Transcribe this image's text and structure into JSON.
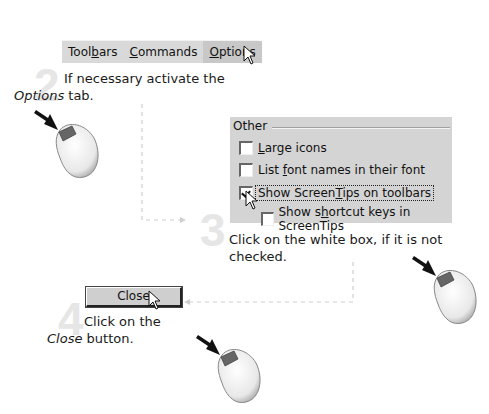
{
  "steps": [
    {
      "number": "2",
      "text_before": "If necessary activate the ",
      "text_emph": "Options",
      "text_after": " tab."
    },
    {
      "number": "3",
      "text": "Click on the white box, if it is not checked."
    },
    {
      "number": "4",
      "text_before": "Click on the ",
      "text_emph": "Close",
      "text_after": " button."
    }
  ],
  "tabs": [
    {
      "label_pre": "Tool",
      "label_ul": "b",
      "label_post": "ars",
      "active": false
    },
    {
      "label_pre": "",
      "label_ul": "C",
      "label_post": "ommands",
      "active": false
    },
    {
      "label_pre": "",
      "label_ul": "O",
      "label_post": "ptions",
      "active": true
    }
  ],
  "options_panel": {
    "group_title": "Other",
    "checkboxes": [
      {
        "pre": "",
        "ul": "L",
        "post": "arge icons",
        "checked": false
      },
      {
        "pre": "List ",
        "ul": "f",
        "post": "ont names in their font",
        "checked": false
      },
      {
        "pre": "Show Screen",
        "ul": "T",
        "post": "ips on toolbars",
        "checked": true
      },
      {
        "pre": "Show s",
        "ul": "h",
        "post": "ortcut keys in ScreenTips",
        "checked": false
      }
    ]
  },
  "close_button": {
    "label": "Close"
  },
  "icons": {
    "mouse": "mouse-left-click-icon",
    "cursor": "arrow-cursor-icon"
  },
  "colors": {
    "panel_bg": "#d4d4d4",
    "step_number": "#e6e6e6",
    "connector": "#c8c8c8"
  }
}
